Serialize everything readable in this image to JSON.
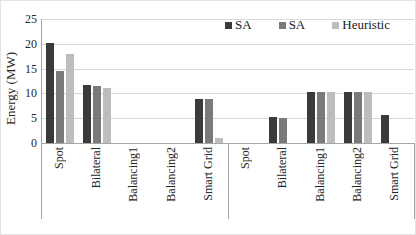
{
  "chart_data": {
    "type": "bar",
    "title": "",
    "ylabel": "Energy (MW)",
    "xlabel": "",
    "ylim": [
      0,
      25
    ],
    "yticks": [
      0,
      5,
      10,
      15,
      20,
      25
    ],
    "grid": true,
    "legend_position": "top-right",
    "series": [
      {
        "name": "SA",
        "color": "#3a3a3a"
      },
      {
        "name": "SA",
        "color": "#7a7a7a"
      },
      {
        "name": "Heuristic",
        "color": "#bdbdbd"
      }
    ],
    "groups": [
      {
        "name": "",
        "categories": [
          "Spot",
          "Bilateral",
          "Balancing1",
          "Balancing2",
          "Smart Grid"
        ],
        "series_values": [
          [
            20.2,
            11.6,
            0,
            0,
            8.8
          ],
          [
            14.5,
            11.5,
            0,
            0,
            8.8
          ],
          [
            18.0,
            11.1,
            0,
            0,
            1.1
          ]
        ]
      },
      {
        "name": "",
        "categories": [
          "Spot",
          "Bilateral",
          "Balancing1",
          "Balancing2",
          "Smart Grid"
        ],
        "series_values": [
          [
            0,
            5.2,
            10.2,
            10.2,
            5.6
          ],
          [
            0,
            5.0,
            10.2,
            10.2,
            0
          ],
          [
            0,
            0,
            10.3,
            10.3,
            0
          ]
        ]
      }
    ]
  }
}
